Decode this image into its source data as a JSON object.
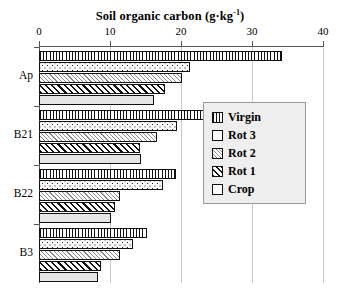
{
  "chart_data": {
    "type": "bar",
    "orientation": "horizontal",
    "title_main": "Soil organic carbon (g·kg",
    "title_sup": "-1",
    "title_tail": ")",
    "xlabel": "Soil organic carbon (g·kg-1)",
    "ylabel": "",
    "xlim": [
      0,
      40
    ],
    "xticks": [
      0,
      10,
      20,
      30,
      40
    ],
    "xtick_labels": [
      "0",
      "10",
      "20",
      "30",
      "40"
    ],
    "categories": [
      "Ap",
      "B21",
      "B22",
      "B3"
    ],
    "grid": "vertical",
    "legend_position": "right-middle",
    "series": [
      {
        "name": "Virgin",
        "pattern": "vertical-lines",
        "values": [
          34.2,
          25.2,
          19.3,
          15.2
        ]
      },
      {
        "name": "Rot 3",
        "pattern": "dots",
        "values": [
          21.2,
          19.4,
          17.4,
          13.2
        ]
      },
      {
        "name": "Rot 2",
        "pattern": "fine-hatch",
        "values": [
          20.1,
          16.6,
          11.4,
          11.4
        ]
      },
      {
        "name": "Rot 1",
        "pattern": "bold-hatch",
        "values": [
          17.7,
          14.2,
          10.7,
          8.8
        ]
      },
      {
        "name": "Crop",
        "pattern": "solid-gray",
        "values": [
          16.2,
          14.4,
          10.2,
          8.3
        ]
      }
    ]
  },
  "legend": {
    "items": [
      {
        "label": "Virgin"
      },
      {
        "label": "Rot 3"
      },
      {
        "label": "Rot 2"
      },
      {
        "label": "Rot 1"
      },
      {
        "label": "Crop"
      }
    ]
  },
  "colors": {
    "axis": "#555555",
    "grid": "#c9c9c9",
    "bar_outline": "#111111",
    "legend_bg": "#eeeeee",
    "legend_border": "#9a9a9a",
    "crop_fill": "#e6e6e6"
  }
}
